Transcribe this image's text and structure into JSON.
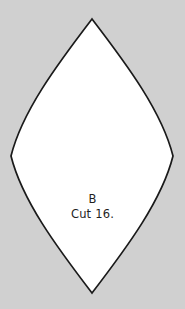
{
  "canvas": {
    "width": 185,
    "height": 309,
    "background_color": "#d0d0d0"
  },
  "pattern_piece": {
    "piece_id": "B",
    "cut_instruction": "Cut 16.",
    "shape_name": "pointed-oval",
    "fill_color": "#ffffff",
    "outline_color": "#1a1a1a",
    "outline_width": 1.7,
    "geometry": {
      "top_point": [
        92,
        19
      ],
      "bottom_point": [
        92,
        293
      ],
      "left_extreme": [
        11,
        156
      ],
      "right_extreme": [
        173,
        156
      ],
      "width": 162,
      "height": 274
    },
    "text_color": "#1f1f1f"
  }
}
